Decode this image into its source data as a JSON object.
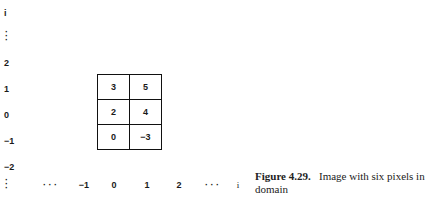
{
  "y_axis": {
    "top_label": "i",
    "labels": [
      "2",
      "1",
      "0",
      "−1",
      "−2"
    ],
    "ellipsis": "⋮"
  },
  "x_axis": {
    "left_ellipsis": "· · ·",
    "labels": [
      "−1",
      "0",
      "1",
      "2"
    ],
    "right_ellipsis": "· · ·",
    "end_label": "i"
  },
  "grid": {
    "rows": [
      [
        "3",
        "5"
      ],
      [
        "2",
        "4"
      ],
      [
        "0",
        "−3"
      ]
    ]
  },
  "caption": {
    "label": "Figure 4.29.",
    "text": "Image with six pixels in domain"
  }
}
